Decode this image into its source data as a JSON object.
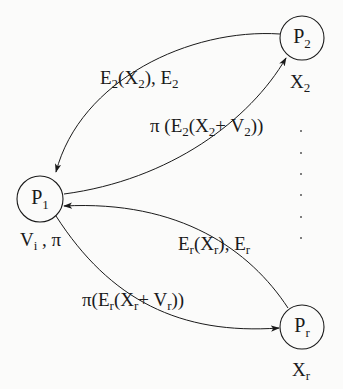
{
  "diagram": {
    "type": "process-communication-graph",
    "colors": {
      "background": "#fbfbfa",
      "stroke": "#1a1a1a",
      "dots": "#555555"
    },
    "nodes": [
      {
        "id": "P1",
        "base": "P",
        "sub": "1",
        "attr_label": {
          "main1": "V",
          "sub1": "i",
          "sep": " , ",
          "main2": "π"
        }
      },
      {
        "id": "P2",
        "base": "P",
        "sub": "2",
        "attr_label": {
          "base": "X",
          "sub": "2"
        }
      },
      {
        "id": "Pr",
        "base": "P",
        "sub": "r",
        "attr_label": {
          "base": "X",
          "sub": "r"
        }
      }
    ],
    "edges": [
      {
        "from": "P2",
        "to": "P1",
        "label": {
          "p1": "E",
          "s1": "2",
          "p2": "(X",
          "s2": "2",
          "p3": "), E",
          "s3": "2"
        }
      },
      {
        "from": "P1",
        "to": "P2",
        "label": {
          "p1": "π (E",
          "s1": "2",
          "p2": "(X",
          "s2": "2",
          "p3": "+ V",
          "s3": "2",
          "p4": "))"
        }
      },
      {
        "from": "Pr",
        "to": "P1",
        "label": {
          "p1": "E",
          "s1": "r",
          "p2": "(X",
          "s2": "r",
          "p3": "), E",
          "s3": "r"
        }
      },
      {
        "from": "P1",
        "to": "Pr",
        "label": {
          "p1": "π(E",
          "s1": "r",
          "p2": "(X",
          "s2": "r",
          "p3": "+ V",
          "s3": "r",
          "p4": "))"
        }
      }
    ],
    "ellipsis": {
      "orientation": "vertical",
      "count": 6
    }
  }
}
